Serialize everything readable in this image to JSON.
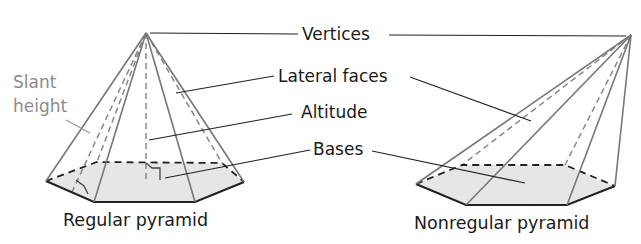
{
  "figure": {
    "labels": {
      "vertices": "Vertices",
      "lateral_faces": "Lateral faces",
      "altitude": "Altitude",
      "bases": "Bases",
      "slant_height_line1": "Slant",
      "slant_height_line2": "height"
    },
    "captions": {
      "regular": "Regular pyramid",
      "nonregular": "Nonregular pyramid"
    },
    "colors": {
      "base_fill": "#e6e6e6",
      "edge": "#777777",
      "text": "#1a1a1a",
      "slant_label": "#8a8a8a"
    }
  }
}
